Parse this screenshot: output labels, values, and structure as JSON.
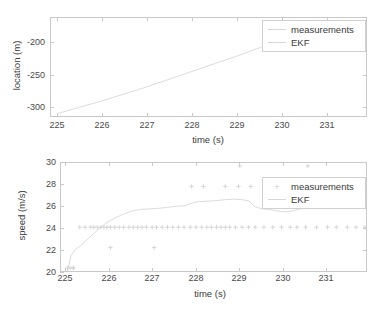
{
  "figure": {
    "background": "#ffffff",
    "axis_color": "#c9c9c9",
    "text_color": "#3a3a3a",
    "series_color": "#d8d8d8",
    "marker_color": "#d2d2d2"
  },
  "legend": {
    "measurements_label": "measurements",
    "ekf_label": "EKF",
    "marker_glyph": "+"
  },
  "chart_data": [
    {
      "type": "line",
      "id": "location-plot",
      "title": "",
      "xlabel": "time (s)",
      "ylabel": "location (m)",
      "xlim": [
        224.85,
        231.85
      ],
      "ylim": [
        -330,
        -175
      ],
      "xticks": [
        225,
        226,
        227,
        228,
        229,
        230,
        231
      ],
      "xticklabels": [
        "225",
        "226",
        "227",
        "228",
        "229",
        "230",
        "231"
      ],
      "yticks": [
        -200,
        -250,
        -300
      ],
      "yticklabels": [
        "-200",
        "-250",
        "-300"
      ],
      "grid": false,
      "legend_position": "top-right",
      "series": [
        {
          "name": "measurements",
          "style": "marker",
          "marker": "+",
          "x": [],
          "y": []
        },
        {
          "name": "EKF",
          "style": "line",
          "x": [
            225.0,
            225.5,
            226.0,
            226.5,
            227.0,
            227.5,
            228.0,
            228.5,
            229.0,
            229.5,
            229.8
          ],
          "y": [
            -325,
            -315,
            -305,
            -294,
            -283,
            -271,
            -259,
            -247,
            -235,
            -222,
            -213
          ]
        }
      ]
    },
    {
      "type": "scatter",
      "id": "speed-plot",
      "title": "",
      "xlabel": "time (s)",
      "ylabel": "speed (m/s)",
      "xlim": [
        224.85,
        231.85
      ],
      "ylim": [
        19.6,
        30.4
      ],
      "xticks": [
        225,
        226,
        227,
        228,
        229,
        230,
        231
      ],
      "xticklabels": [
        "225",
        "226",
        "227",
        "228",
        "229",
        "230",
        "231"
      ],
      "yticks": [
        20,
        22,
        24,
        26,
        28,
        30
      ],
      "yticklabels": [
        "20",
        "22",
        "24",
        "26",
        "28",
        "30"
      ],
      "grid": false,
      "legend_position": "top-right",
      "series": [
        {
          "name": "measurements",
          "style": "marker",
          "marker": "+",
          "x": [
            225.02,
            225.08,
            225.16,
            225.3,
            225.42,
            225.55,
            225.62,
            225.7,
            225.78,
            225.85,
            225.92,
            226.0,
            226.1,
            226.2,
            226.3,
            226.42,
            226.52,
            226.62,
            226.72,
            226.82,
            226.95,
            227.05,
            227.18,
            227.3,
            227.42,
            227.55,
            227.68,
            227.82,
            227.95,
            228.08,
            228.2,
            228.3,
            228.42,
            228.52,
            228.62,
            228.72,
            228.85,
            229.0,
            229.15,
            229.3,
            229.5,
            229.7,
            229.9,
            230.1,
            230.25,
            230.45,
            230.7,
            230.95,
            231.15,
            231.4,
            231.6,
            231.8,
            225.15,
            226.0,
            227.0,
            227.85,
            228.12,
            228.62,
            228.92,
            229.2,
            230.15,
            231.75,
            228.95,
            230.5
          ],
          "y": [
            20,
            20,
            20,
            24,
            24,
            24,
            24,
            24,
            24,
            24,
            24,
            24,
            24,
            24,
            24,
            24,
            24,
            24,
            24,
            24,
            24,
            24,
            24,
            24,
            24,
            24,
            24,
            24,
            24,
            24,
            24,
            24,
            24,
            24,
            24,
            24,
            24,
            24,
            24,
            24,
            24,
            24,
            24,
            24,
            24,
            24,
            24,
            24,
            24,
            24,
            24,
            24,
            20,
            22,
            22,
            28,
            28,
            28,
            28,
            28,
            26,
            28,
            30,
            30
          ]
        },
        {
          "name": "EKF",
          "style": "line",
          "x": [
            225.02,
            225.1,
            225.2,
            225.32,
            225.45,
            225.6,
            225.75,
            225.9,
            226.1,
            226.3,
            226.5,
            226.7,
            226.9,
            227.1,
            227.3,
            227.5,
            227.7,
            227.85,
            228.0,
            228.2,
            228.4,
            228.6,
            228.8,
            229.0,
            229.15,
            229.3,
            229.45,
            229.6,
            229.8,
            230.0,
            230.2,
            230.4,
            230.6,
            230.8,
            231.0,
            231.2,
            231.45,
            231.7,
            231.85
          ],
          "y": [
            19.7,
            21.2,
            21.8,
            22.2,
            22.7,
            23.3,
            23.9,
            24.4,
            24.9,
            25.3,
            25.6,
            25.75,
            25.8,
            25.85,
            25.95,
            26.05,
            26.1,
            26.35,
            26.5,
            26.55,
            26.6,
            26.7,
            26.75,
            26.7,
            26.6,
            26.0,
            25.8,
            25.75,
            25.6,
            25.5,
            25.65,
            25.9,
            26.0,
            26.1,
            26.3,
            26.5,
            26.6,
            26.65,
            26.7
          ]
        }
      ]
    }
  ]
}
